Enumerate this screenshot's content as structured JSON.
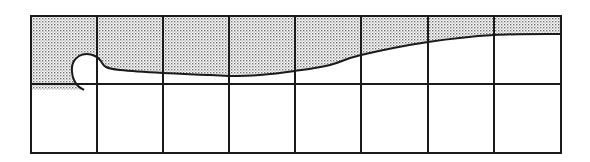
{
  "diagram": {
    "colors": {
      "background": "#ffffff",
      "line": "#1a1a1a",
      "stipple_dot": "#6e6e6e"
    },
    "grid": {
      "left": 31,
      "right": 561,
      "top": 16,
      "middle": 84,
      "bottom": 153,
      "columns": [
        31,
        97,
        163,
        229,
        295,
        361,
        428,
        494,
        561
      ]
    },
    "surface_curve_points": [
      [
        561,
        34
      ],
      [
        494,
        35
      ],
      [
        428,
        42
      ],
      [
        361,
        55
      ],
      [
        330,
        65
      ],
      [
        295,
        71
      ],
      [
        260,
        75
      ],
      [
        229,
        76
      ],
      [
        210,
        75
      ],
      [
        163,
        73
      ],
      [
        120,
        70
      ],
      [
        106,
        67
      ],
      [
        100,
        60
      ],
      [
        95,
        56
      ],
      [
        87,
        54
      ],
      [
        79,
        56
      ],
      [
        73,
        63
      ],
      [
        72,
        72
      ],
      [
        74,
        80
      ],
      [
        78,
        86
      ],
      [
        84,
        90
      ]
    ],
    "lower_strip": {
      "top": 84,
      "bottom": 90,
      "left": 31,
      "right": 84
    }
  }
}
